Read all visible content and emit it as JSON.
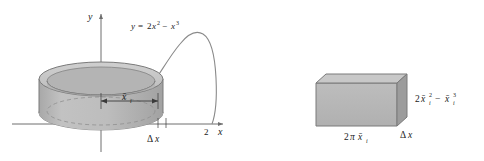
{
  "figure": {
    "panels": [
      {
        "name": "shell-under-curve",
        "axis_y_label": "y",
        "axis_x_label": "x",
        "x_tick_label": "2",
        "curve_equation": "y = 2x² − x³",
        "curve_equation_parts": {
          "lhs": "y",
          "eq": "=",
          "term1_coeff": "2",
          "term1_var": "x",
          "term1_exp": "2",
          "minus": "−",
          "term2_var": "x",
          "term2_exp": "3"
        },
        "radius_label": "x̄",
        "radius_label_sub": "i",
        "thickness_label": "Δx",
        "thickness_label_parts": {
          "delta": "Δ",
          "var": "x"
        }
      },
      {
        "name": "unrolled-slab",
        "width_label": "2πx̄",
        "width_label_sub": "i",
        "width_label_parts": {
          "two": "2",
          "pi": "π",
          "xbar": "x̄",
          "sub": "i"
        },
        "height_label": "2x̄ᵢ² − x̄ᵢ³",
        "height_label_parts": {
          "two": "2",
          "xbar1": "x̄",
          "sub1": "i",
          "exp1": "2",
          "minus": "−",
          "xbar2": "x̄",
          "sub2": "i",
          "exp2": "3"
        },
        "depth_label": "Δx",
        "depth_label_parts": {
          "delta": "Δ",
          "var": "x"
        }
      }
    ],
    "colors": {
      "ink": "#1a1a1a",
      "axis": "#6e6e6e",
      "curve": "#8a8a8a",
      "shell_face": "#b9b9b9",
      "shell_top": "#c9c9c9",
      "shell_inner": "#a9a9a9",
      "slab_face": "#b2b2b2",
      "slab_top": "#c6c6c6",
      "slab_side": "#9a9a9a",
      "outline": "#7a7a7a",
      "background": "#ffffff"
    }
  }
}
